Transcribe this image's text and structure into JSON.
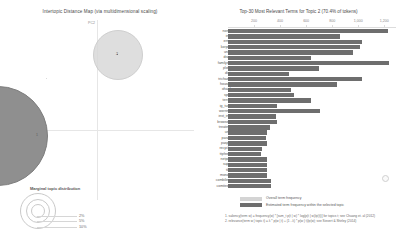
{
  "left": {
    "title": "Intertopic Distance Map (via multidimensional scaling)",
    "axes": {
      "x_label": "PC1",
      "y_label": "PC2"
    },
    "topics": [
      {
        "id": "1",
        "label": "1",
        "selected": true,
        "radius_pct": 49,
        "cx_pct": -1.5,
        "cy_pct": 63
      },
      {
        "id": "2",
        "label": "2",
        "selected": false,
        "radius_pct": 24,
        "cx_pct": 60,
        "cy_pct": 19
      }
    ],
    "marginal_legend": {
      "title": "Marginal topic distribution",
      "ticks": [
        "2%",
        "5%",
        "10%"
      ]
    }
  },
  "right": {
    "title": "Top-30 Most Relevant Terms for Topic 2 (70.4% of tokens)",
    "legend": [
      {
        "label": "Overall term frequency",
        "color": "#d4d4d4"
      },
      {
        "label": "Estimated term frequency within the selected topic",
        "color": "#6e6e6e"
      }
    ],
    "footnotes": [
      "1. saliency(term w) = frequency(w) * [sum_t p(t | w) * log(p(t | w)/p(t))] for topics t; see Chuang et. al (2012)",
      "2. relevance(term w | topic t) = λ * p(w | t) + (1 - λ) * p(w | t)/p(w); see Sievert & Shirley (2014)"
    ]
  },
  "chart_data": {
    "type": "bar",
    "title": "Top-30 Most Relevant Terms for Topic 2 (70.4% of tokens)",
    "orientation": "horizontal",
    "xlabel": "",
    "ylabel": "",
    "xlim": [
      0,
      1290
    ],
    "xticks": [
      200,
      400,
      600,
      800,
      1000,
      1200
    ],
    "xtick_labels": [
      "200",
      "400",
      "600",
      "800",
      "1,000",
      "1,200"
    ],
    "grid": false,
    "legend_position": "bottom",
    "categories": [
      "norm",
      "ing",
      "erne",
      "korpet",
      "unib",
      "drag",
      "familyse",
      "plotb",
      "dist",
      "trichaex",
      "houset",
      "ohaal",
      "sprit",
      "terrie",
      "ig_turn",
      "worring",
      "inst_ing",
      "browsep",
      "treating",
      "unti",
      "paran",
      "paspa",
      "recycle",
      "ttpfeed",
      "netpar",
      "supa",
      "tikt",
      "monay",
      "combiling",
      "comitees"
    ],
    "series": [
      {
        "name": "Overall term frequency",
        "values": [
          1230,
          860,
          1030,
          1010,
          960,
          640,
          1240,
          700,
          470,
          1030,
          840,
          480,
          510,
          640,
          380,
          710,
          370,
          380,
          320,
          300,
          290,
          300,
          260,
          250,
          300,
          300,
          300,
          300,
          330,
          330
        ]
      },
      {
        "name": "Estimated term frequency within the selected topic",
        "values": [
          1230,
          860,
          1030,
          1010,
          960,
          640,
          1240,
          700,
          470,
          1030,
          840,
          480,
          510,
          640,
          380,
          710,
          370,
          380,
          320,
          300,
          290,
          300,
          260,
          250,
          300,
          300,
          300,
          300,
          330,
          330
        ]
      }
    ]
  }
}
